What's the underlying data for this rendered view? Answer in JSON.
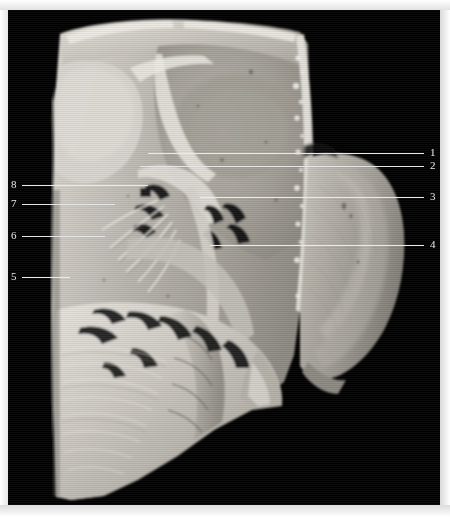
{
  "plate": {
    "background_color": "#ffffff",
    "photo_background_color": "#010101",
    "leader_color": "#e8e8e8",
    "label_color": "#e9e9e9",
    "label_color_on_white": "#2b2b2b",
    "image_type": "anatomical-dissection-photograph",
    "orientation": "sagittal-parasagittal-section"
  },
  "labels": [
    {
      "id": "label-1",
      "text": "1",
      "side": "right",
      "number_x": 430,
      "number_y": 147,
      "leader_y": 153,
      "leader_from_x": 148,
      "leader_to_x": 424
    },
    {
      "id": "label-2",
      "text": "2",
      "side": "right",
      "number_x": 430,
      "number_y": 160,
      "leader_y": 166,
      "leader_from_x": 140,
      "leader_to_x": 424
    },
    {
      "id": "label-3",
      "text": "3",
      "side": "right",
      "number_x": 430,
      "number_y": 191,
      "leader_y": 197,
      "leader_from_x": 200,
      "leader_to_x": 424
    },
    {
      "id": "label-4",
      "text": "4",
      "side": "right",
      "number_x": 430,
      "number_y": 239,
      "leader_y": 245,
      "leader_from_x": 210,
      "leader_to_x": 424
    },
    {
      "id": "label-5",
      "text": "5",
      "side": "left",
      "number_x": 11,
      "number_y": 271,
      "leader_y": 277,
      "leader_from_x": 22,
      "leader_to_x": 70
    },
    {
      "id": "label-6",
      "text": "6",
      "side": "left",
      "number_x": 11,
      "number_y": 230,
      "leader_y": 236,
      "leader_from_x": 22,
      "leader_to_x": 105
    },
    {
      "id": "label-7",
      "text": "7",
      "side": "left",
      "number_x": 11,
      "number_y": 198,
      "leader_y": 204,
      "leader_from_x": 22,
      "leader_to_x": 115
    },
    {
      "id": "label-8",
      "text": "8",
      "side": "left",
      "number_x": 11,
      "number_y": 179,
      "leader_y": 185,
      "leader_from_x": 22,
      "leader_to_x": 148
    }
  ]
}
